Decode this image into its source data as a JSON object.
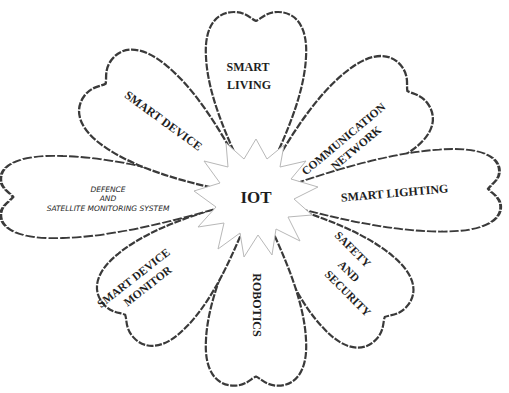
{
  "diagram": {
    "center": {
      "label": "IOT"
    },
    "petals": [
      {
        "id": "smart-living",
        "lines": [
          "SMART",
          "LIVING"
        ]
      },
      {
        "id": "communication-network",
        "lines": [
          "COMMUNICATION",
          "NETWORK"
        ]
      },
      {
        "id": "smart-lighting",
        "lines": [
          "SMART LIGHTING"
        ]
      },
      {
        "id": "safety-and-security",
        "lines": [
          "SAFETY",
          "AND",
          "SECURITY"
        ]
      },
      {
        "id": "robotics",
        "lines": [
          "ROBOTICS"
        ]
      },
      {
        "id": "smart-device-monitor",
        "lines": [
          "SMART DEVICE",
          "MONITOR"
        ]
      },
      {
        "id": "defence-satellite",
        "lines": [
          "DEFENCE",
          "AND",
          "SATELLITE MONITORING SYSTEM"
        ]
      },
      {
        "id": "smart-device",
        "lines": [
          "SMART DEVICE"
        ]
      }
    ]
  }
}
